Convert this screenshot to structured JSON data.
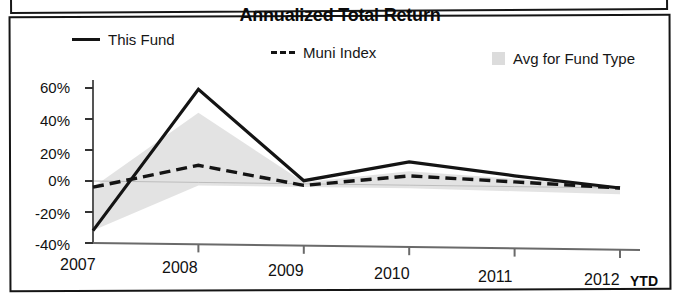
{
  "chart_data": {
    "type": "line",
    "title": "Annualized Total Return",
    "xlabel": "",
    "ylabel": "",
    "categories": [
      "2007",
      "2008",
      "2009",
      "2010",
      "2011",
      "2012"
    ],
    "x_axis_note": "YTD",
    "ylim": [
      -40,
      60
    ],
    "ytick_labels": [
      "60%",
      "40%",
      "20%",
      "0%",
      "-20%",
      "-40%"
    ],
    "ytick_values": [
      60,
      40,
      20,
      0,
      -20,
      -40
    ],
    "grid": false,
    "legend_position": "top",
    "legend": [
      {
        "name": "This Fund",
        "marker": "solid-line",
        "color": "#141414"
      },
      {
        "name": "Muni Index",
        "marker": "dashed-line",
        "color": "#141414"
      },
      {
        "name": "Avg for Fund Type",
        "marker": "filled-square",
        "color": "#dcdcdc"
      }
    ],
    "series": [
      {
        "name": "This Fund",
        "style": "solid",
        "values": [
          -32,
          60,
          2,
          15,
          7,
          0
        ]
      },
      {
        "name": "Muni Index",
        "style": "dashed",
        "values": [
          -4,
          11,
          -1,
          6,
          3,
          0
        ]
      },
      {
        "name": "Avg for Fund Type",
        "style": "band-upper",
        "values": [
          -4,
          45,
          1,
          9,
          5,
          0
        ]
      },
      {
        "name": "Avg for Fund Type",
        "style": "band-lower",
        "values": [
          -32,
          -2,
          -2,
          -2,
          -3,
          -4
        ]
      }
    ]
  },
  "chart": {
    "title": "Annualized Total Return",
    "legend": {
      "this_fund": "This Fund",
      "muni_index": "Muni Index",
      "avg_for_fund_type": "Avg for Fund Type"
    },
    "y_ticks": {
      "t0": "60%",
      "t1": "40%",
      "t2": "20%",
      "t3": "0%",
      "t4": "-20%",
      "t5": "-40%"
    },
    "x_ticks": {
      "t0": "2007",
      "t1": "2008",
      "t2": "2009",
      "t3": "2010",
      "t4": "2011",
      "t5": "2012"
    },
    "ytd": "YTD"
  },
  "colors": {
    "line": "#141414",
    "band_fill": "#e2e2e2",
    "axis": "#4a4a4a",
    "frame": "#151515"
  }
}
